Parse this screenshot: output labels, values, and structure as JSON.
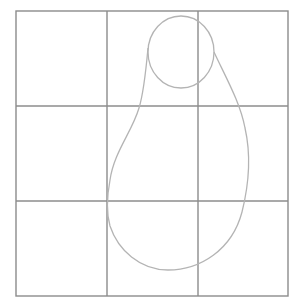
{
  "drawing": {
    "description": "Pencil sketch: 3x3 guide grid with pear-shaped body and circular head outline",
    "grid": {
      "rows": 3,
      "cols": 3,
      "x": [
        16,
        107,
        198,
        288
      ],
      "y": [
        11,
        106,
        201,
        296
      ],
      "color": "#8c8c8c"
    },
    "head_circle": {
      "cx": 181,
      "cy": 52,
      "rx": 33,
      "ry": 36
    },
    "body_outline_color": "#b4b4b4"
  }
}
